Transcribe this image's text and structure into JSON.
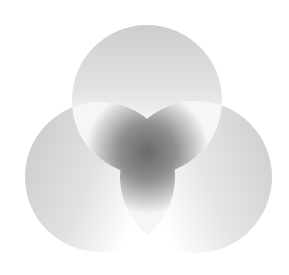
{
  "diagram": {
    "type": "three-circle-venn",
    "background": "#ffffff",
    "circles": [
      {
        "id": "top",
        "cx": 147,
        "cy": 100,
        "r": 75,
        "fill_light": "#fbfbfb",
        "fill_dark": "#cfcfcf"
      },
      {
        "id": "left",
        "cx": 100,
        "cy": 177,
        "r": 75,
        "fill_light": "#ffffff",
        "fill_dark": "#c8c8c8"
      },
      {
        "id": "right",
        "cx": 196,
        "cy": 177,
        "r": 76,
        "fill_light": "#ffffff",
        "fill_dark": "#cccccc"
      }
    ],
    "center_region": {
      "shape": "trefoil",
      "darkest": "#6e6e6e",
      "edge": "#f2f2f2"
    },
    "labels": []
  }
}
